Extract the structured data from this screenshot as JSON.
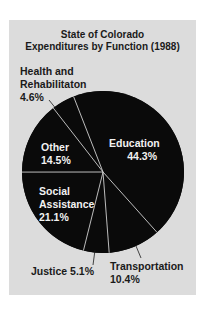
{
  "chart_data": {
    "type": "pie",
    "title": "State of Colorado Expenditures by Function (1988)",
    "title_lines": [
      "State of Colorado",
      "Expenditures by Function (1988)"
    ],
    "categories": [
      "Education",
      "Transportation",
      "Justice",
      "Social Assistance",
      "Other",
      "Health and Rehabilitaton"
    ],
    "values": [
      44.3,
      10.4,
      5.1,
      21.1,
      14.5,
      4.6
    ],
    "unit": "%",
    "slice_color": "#0a0a0a",
    "divider_color": "#d0d0d0",
    "background": "#dcdcdc",
    "legend": "none (labels on/next to slices)"
  },
  "labels": {
    "health_name_1": "Health and",
    "health_name_2": "Rehabilitaton",
    "health_value": "4.6%",
    "other_name": "Other",
    "other_value": "14.5%",
    "education_name": "Education",
    "education_value": "44.3%",
    "social_name_1": "Social",
    "social_name_2": "Assistance",
    "social_value": "21.1%",
    "justice": "Justice 5.1%",
    "transport_name": "Transportation",
    "transport_value": "10.4%"
  }
}
